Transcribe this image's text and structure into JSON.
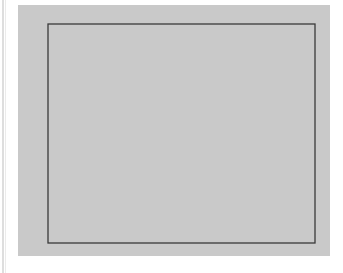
{
  "figure": {
    "background_color": "#c9c9c9",
    "page_color": "#ffffff",
    "axis_color": "#3a3a3a",
    "curve_color": "#1a1a1a",
    "marker_color": "#111111"
  },
  "chart_data": {
    "type": "line",
    "title": "",
    "subtitle": "",
    "xlabel": "",
    "ylabel": "",
    "xlim": [
      -1,
      1
    ],
    "ylim": [
      0,
      1.04
    ],
    "grid": false,
    "legend": null,
    "legend_position": "none",
    "xticks": [
      -1,
      -0.5,
      0,
      0.5,
      1
    ],
    "xtick_labels": [
      "−1",
      "−0.5",
      "0",
      "0.5",
      "1"
    ],
    "yticks": [
      0,
      0.2,
      0.4,
      0.6,
      0.8,
      1
    ],
    "ytick_labels": [
      "0",
      "0.2",
      "0.4",
      "0.6",
      "0.8",
      "1"
    ],
    "annotations": [],
    "series": [
      {
        "name": "interpolating polynomial",
        "style": "solid",
        "marker": "none",
        "linewidth": 1.8,
        "x": [
          -1.0,
          -0.975,
          -0.95,
          -0.925,
          -0.9,
          -0.875,
          -0.85,
          -0.825,
          -0.8,
          -0.775,
          -0.75,
          -0.725,
          -0.7,
          -0.675,
          -0.65,
          -0.625,
          -0.6,
          -0.575,
          -0.55,
          -0.525,
          -0.5,
          -0.475,
          -0.45,
          -0.425,
          -0.4,
          -0.375,
          -0.35,
          -0.325,
          -0.3,
          -0.275,
          -0.25,
          -0.225,
          -0.2,
          -0.175,
          -0.15,
          -0.125,
          -0.1,
          -0.075,
          -0.05,
          -0.025,
          0.0,
          0.025,
          0.05,
          0.075,
          0.1,
          0.125,
          0.15,
          0.175,
          0.2,
          0.225,
          0.25,
          0.275,
          0.3,
          0.325,
          0.35,
          0.375,
          0.4,
          0.425,
          0.45,
          0.475,
          0.5,
          0.525,
          0.55,
          0.575,
          0.6,
          0.625,
          0.65,
          0.675,
          0.7,
          0.725,
          0.75,
          0.775,
          0.8,
          0.825,
          0.85,
          0.875,
          0.9,
          0.925,
          0.95,
          0.975,
          1.0
        ],
        "y": [
          0.0385,
          0.0556,
          0.0685,
          0.0777,
          0.0839,
          0.0876,
          0.0893,
          0.0894,
          0.0883,
          0.0864,
          0.0839,
          0.0813,
          0.0788,
          0.0768,
          0.0756,
          0.0755,
          0.0769,
          0.0802,
          0.0858,
          0.0941,
          0.1058,
          0.1213,
          0.1414,
          0.1668,
          0.1983,
          0.2369,
          0.2834,
          0.3389,
          0.4043,
          0.4805,
          0.5682,
          0.6675,
          0.7781,
          0.8985,
          1.0255,
          1.1538,
          1.2752,
          1.3784,
          1.4498,
          1.4755,
          1.4444,
          1.4755,
          1.4498,
          1.3784,
          1.2752,
          1.1538,
          1.0255,
          0.8985,
          0.7781,
          0.6675,
          0.5682,
          0.4805,
          0.4043,
          0.3389,
          0.2834,
          0.2369,
          0.1983,
          0.1668,
          0.1414,
          0.1213,
          0.1058,
          0.0941,
          0.0858,
          0.0802,
          0.0769,
          0.0755,
          0.0756,
          0.0768,
          0.0788,
          0.0813,
          0.0839,
          0.0864,
          0.0883,
          0.0894,
          0.0893,
          0.0876,
          0.0839,
          0.0777,
          0.0685,
          0.0556,
          0.0385
        ]
      },
      {
        "name": "runge function nodes",
        "style": "dashed",
        "marker": "filled-circle",
        "linewidth": 1.6,
        "x": [
          -1,
          -0.75,
          -0.5,
          -0.25,
          0,
          0.25,
          0.5,
          0.75,
          1
        ],
        "y": [
          0.0385,
          0.0664,
          0.1379,
          0.3902,
          1.0,
          0.3902,
          0.1379,
          0.0664,
          0.0385
        ]
      }
    ]
  }
}
